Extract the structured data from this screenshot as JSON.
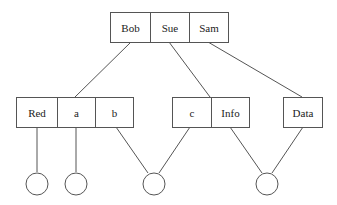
{
  "diagram": {
    "type": "tree",
    "stroke_color": "#555555",
    "root": {
      "cells": [
        "Bob",
        "Sue",
        "Sam"
      ]
    },
    "children": [
      {
        "cells": [
          "Red",
          "a",
          "b"
        ]
      },
      {
        "cells": [
          "c",
          "Info"
        ]
      },
      {
        "cells": [
          "Data"
        ]
      }
    ],
    "leaves": [
      {
        "shape": "circle",
        "linked_from": [
          "Red"
        ]
      },
      {
        "shape": "circle",
        "linked_from": [
          "a"
        ]
      },
      {
        "shape": "circle",
        "linked_from": [
          "b",
          "c"
        ]
      },
      {
        "shape": "circle",
        "linked_from": [
          "Info",
          "Data"
        ]
      }
    ],
    "edges": [
      {
        "from": "Bob",
        "to": "Red-a-b node"
      },
      {
        "from": "Sue",
        "to": "c-Info node"
      },
      {
        "from": "Sam",
        "to": "Data node"
      }
    ]
  }
}
